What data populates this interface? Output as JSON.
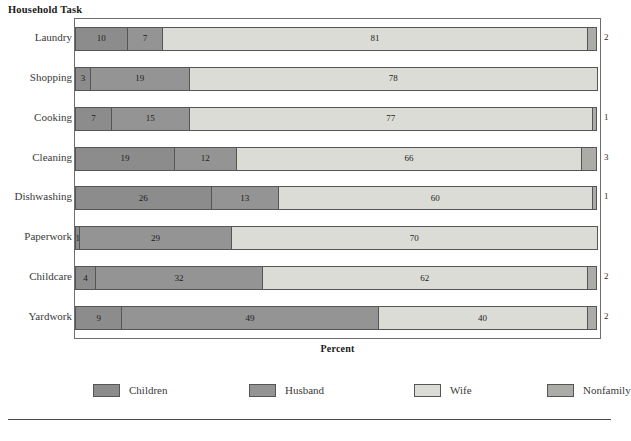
{
  "chart_data": {
    "type": "bar",
    "orientation": "horizontal",
    "stacked": true,
    "stack_mode": "percent",
    "title": "Household Task",
    "xlabel": "Percent",
    "ylabel": "Household Task",
    "xlim": [
      0,
      100
    ],
    "grid": false,
    "legend_position": "bottom",
    "categories": [
      "Laundry",
      "Shopping",
      "Cooking",
      "Cleaning",
      "Dishwashing",
      "Paperwork",
      "Childcare",
      "Yardwork"
    ],
    "series": [
      {
        "name": "Children",
        "color": "#8c8c8c",
        "values": [
          10,
          3,
          7,
          19,
          26,
          1,
          4,
          9
        ]
      },
      {
        "name": "Husband",
        "color": "#949494",
        "values": [
          7,
          19,
          15,
          12,
          13,
          29,
          32,
          49
        ]
      },
      {
        "name": "Wife",
        "color": "#dcdcd6",
        "values": [
          81,
          78,
          77,
          66,
          60,
          70,
          62,
          40
        ]
      },
      {
        "name": "Nonfamily",
        "color": "#ababa7",
        "values": [
          2,
          0,
          1,
          3,
          1,
          0,
          2,
          2
        ]
      }
    ],
    "rows": [
      {
        "category": "Laundry",
        "segments": [
          {
            "series": "Children",
            "value": 10,
            "label": "10",
            "label_inside": true
          },
          {
            "series": "Husband",
            "value": 7,
            "label": "7",
            "label_inside": true
          },
          {
            "series": "Wife",
            "value": 81,
            "label": "81",
            "label_inside": true
          },
          {
            "series": "Nonfamily",
            "value": 2,
            "label": "2",
            "label_inside": false
          }
        ]
      },
      {
        "category": "Shopping",
        "segments": [
          {
            "series": "Children",
            "value": 3,
            "label": "3",
            "label_inside": true
          },
          {
            "series": "Husband",
            "value": 19,
            "label": "19",
            "label_inside": true
          },
          {
            "series": "Wife",
            "value": 78,
            "label": "78",
            "label_inside": true
          },
          {
            "series": "Nonfamily",
            "value": 0,
            "label": "",
            "label_inside": false
          }
        ]
      },
      {
        "category": "Cooking",
        "segments": [
          {
            "series": "Children",
            "value": 7,
            "label": "7",
            "label_inside": true
          },
          {
            "series": "Husband",
            "value": 15,
            "label": "15",
            "label_inside": true
          },
          {
            "series": "Wife",
            "value": 77,
            "label": "77",
            "label_inside": true
          },
          {
            "series": "Nonfamily",
            "value": 1,
            "label": "1",
            "label_inside": false
          }
        ]
      },
      {
        "category": "Cleaning",
        "segments": [
          {
            "series": "Children",
            "value": 19,
            "label": "19",
            "label_inside": true
          },
          {
            "series": "Husband",
            "value": 12,
            "label": "12",
            "label_inside": true
          },
          {
            "series": "Wife",
            "value": 66,
            "label": "66",
            "label_inside": true
          },
          {
            "series": "Nonfamily",
            "value": 3,
            "label": "3",
            "label_inside": false
          }
        ]
      },
      {
        "category": "Dishwashing",
        "segments": [
          {
            "series": "Children",
            "value": 26,
            "label": "26",
            "label_inside": true
          },
          {
            "series": "Husband",
            "value": 13,
            "label": "13",
            "label_inside": true
          },
          {
            "series": "Wife",
            "value": 60,
            "label": "60",
            "label_inside": true
          },
          {
            "series": "Nonfamily",
            "value": 1,
            "label": "1",
            "label_inside": false
          }
        ]
      },
      {
        "category": "Paperwork",
        "segments": [
          {
            "series": "Children",
            "value": 1,
            "label": "1",
            "label_inside": true
          },
          {
            "series": "Husband",
            "value": 29,
            "label": "29",
            "label_inside": true
          },
          {
            "series": "Wife",
            "value": 70,
            "label": "70",
            "label_inside": true
          },
          {
            "series": "Nonfamily",
            "value": 0,
            "label": "",
            "label_inside": false
          }
        ]
      },
      {
        "category": "Childcare",
        "segments": [
          {
            "series": "Children",
            "value": 4,
            "label": "4",
            "label_inside": true
          },
          {
            "series": "Husband",
            "value": 32,
            "label": "32",
            "label_inside": true
          },
          {
            "series": "Wife",
            "value": 62,
            "label": "62",
            "label_inside": true
          },
          {
            "series": "Nonfamily",
            "value": 2,
            "label": "2",
            "label_inside": false
          }
        ]
      },
      {
        "category": "Yardwork",
        "segments": [
          {
            "series": "Children",
            "value": 9,
            "label": "9",
            "label_inside": true
          },
          {
            "series": "Husband",
            "value": 49,
            "label": "49",
            "label_inside": true
          },
          {
            "series": "Wife",
            "value": 40,
            "label": "40",
            "label_inside": true
          },
          {
            "series": "Nonfamily",
            "value": 2,
            "label": "2",
            "label_inside": false
          }
        ]
      }
    ],
    "legend": [
      {
        "label": "Children",
        "color": "#8c8c8c"
      },
      {
        "label": "Husband",
        "color": "#949494"
      },
      {
        "label": "Wife",
        "color": "#dcdcd6"
      },
      {
        "label": "Nonfamily",
        "color": "#ababa7"
      }
    ]
  }
}
